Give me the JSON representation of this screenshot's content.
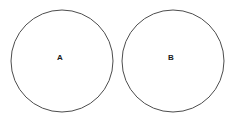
{
  "diagram": {
    "type": "two-circle-diagram",
    "background_color": "#ffffff",
    "stroke_color": "#4d4d4d",
    "stroke_width": 1,
    "fill": "none",
    "canvas": {
      "width": 237,
      "height": 123
    },
    "shapes": [
      {
        "id": "circle-a",
        "shape": "circle",
        "label": "A",
        "center_x": 62,
        "center_y": 61,
        "radius": 51,
        "label_x": 60,
        "label_y": 58
      },
      {
        "id": "circle-b",
        "shape": "circle",
        "label": "B",
        "center_x": 173,
        "center_y": 61,
        "radius": 51,
        "label_x": 171,
        "label_y": 58
      }
    ]
  }
}
